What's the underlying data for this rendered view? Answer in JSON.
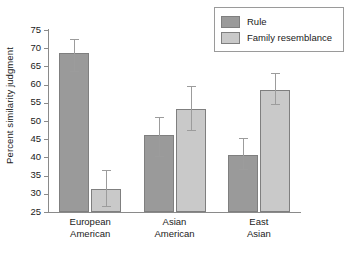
{
  "chart_data": {
    "type": "bar",
    "title": "",
    "subtitle": "",
    "xlabel": "",
    "ylabel": "Percent similarity judgment",
    "categories": [
      "European\nAmerican",
      "Asian\nAmerican",
      "East\nAsian"
    ],
    "category_lines": [
      [
        "European",
        "American"
      ],
      [
        "Asian",
        "American"
      ],
      [
        "East",
        "Asian"
      ]
    ],
    "series": [
      {
        "name": "Rule",
        "color": "#9a9a9a",
        "values": [
          68.7,
          46.2,
          40.8
        ],
        "error_low": [
          63.4,
          40.1,
          36.5
        ],
        "error_high": [
          72.3,
          50.9,
          45.1
        ]
      },
      {
        "name": "Family resemblance",
        "color": "#c9c9c9",
        "values": [
          31.4,
          53.4,
          58.6
        ],
        "error_low": [
          26.3,
          47.3,
          54.3
        ],
        "error_high": [
          36.3,
          59.3,
          62.8
        ]
      }
    ],
    "ylim": [
      25,
      75
    ],
    "yticks": [
      25,
      30,
      35,
      40,
      45,
      50,
      55,
      60,
      65,
      70,
      75
    ],
    "ytick_labels": [
      "25",
      "30",
      "35",
      "40",
      "45",
      "50",
      "55",
      "60",
      "65",
      "70",
      "75"
    ],
    "grid": false,
    "legend_position": "top-right",
    "error_bar_style": "capped"
  },
  "legend": {
    "entries": [
      {
        "label": "Rule",
        "color": "#9a9a9a"
      },
      {
        "label": "Family resemblance",
        "color": "#c9c9c9"
      }
    ]
  },
  "axes": {
    "y_title": "Percent similarity judgment",
    "axis_color": "#8a8a8a"
  },
  "caption": {
    "text": ""
  }
}
